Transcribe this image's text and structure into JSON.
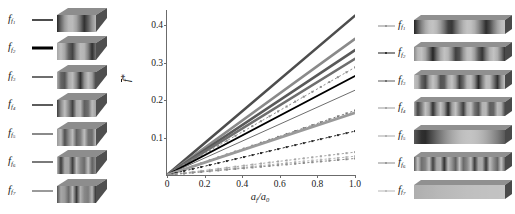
{
  "chart_data": {
    "type": "line",
    "title": "",
    "xlabel": "a_f/a_0",
    "ylabel": "f*",
    "xlim": [
      0,
      1.0
    ],
    "ylim": [
      0,
      0.44
    ],
    "xticks": [
      "0",
      "0.2",
      "0.4",
      "0.6",
      "0.8",
      "1.0"
    ],
    "xtick_values": [
      0,
      0.2,
      0.4,
      0.6,
      0.8,
      1.0
    ],
    "yticks": [
      "0.1",
      "0.2",
      "0.3",
      "0.4"
    ],
    "ytick_values": [
      0.1,
      0.2,
      0.3,
      0.4
    ],
    "grid": false,
    "legend": "none",
    "note": "All series are straight lines through the origin; value listed is y at x = 1.0 (the slope).",
    "series": [
      {
        "name": "f_f1 cube",
        "panel": "left",
        "style": "solid",
        "width": 2.6,
        "color": "#4d4d4d",
        "slope": 0.425,
        "values": [
          0,
          0.085,
          0.17,
          0.255,
          0.34,
          0.425
        ]
      },
      {
        "name": "f_f2 cube",
        "panel": "left",
        "style": "solid",
        "width": 2.6,
        "color": "#8a8a8a",
        "slope": 0.363,
        "values": [
          0,
          0.0726,
          0.1452,
          0.2178,
          0.2904,
          0.363
        ]
      },
      {
        "name": "f_f3 cube",
        "panel": "left",
        "style": "solid",
        "width": 2.6,
        "color": "#595959",
        "slope": 0.333,
        "values": [
          0,
          0.0666,
          0.1332,
          0.1998,
          0.2664,
          0.333
        ]
      },
      {
        "name": "f_f4 cube",
        "panel": "left",
        "style": "solid",
        "width": 2.6,
        "color": "#6e6e6e",
        "slope": 0.31,
        "values": [
          0,
          0.062,
          0.124,
          0.186,
          0.248,
          0.31
        ]
      },
      {
        "name": "f_f5 cube",
        "panel": "left",
        "style": "dotted-marker",
        "width": 1.0,
        "color": "#8f8f8f",
        "slope": 0.287,
        "values": [
          0,
          0.0574,
          0.1148,
          0.1722,
          0.2296,
          0.287
        ]
      },
      {
        "name": "f_f6 cube",
        "panel": "left",
        "style": "solid",
        "width": 1.9,
        "color": "#000000",
        "slope": 0.264,
        "values": [
          0,
          0.0528,
          0.1056,
          0.1584,
          0.2112,
          0.264
        ]
      },
      {
        "name": "f_f7 cube",
        "panel": "left",
        "style": "solid",
        "width": 0.9,
        "color": "#5c5c5c",
        "slope": 0.226,
        "values": [
          0,
          0.0452,
          0.0904,
          0.1356,
          0.1808,
          0.226
        ]
      },
      {
        "name": "f_f1 bar",
        "panel": "right",
        "style": "dotted-marker",
        "width": 1.0,
        "color": "#7a7a7a",
        "slope": 0.172,
        "values": [
          0,
          0.0344,
          0.0688,
          0.1032,
          0.1376,
          0.172
        ]
      },
      {
        "name": "f_f2 bar",
        "panel": "right",
        "style": "solid",
        "width": 2.8,
        "color": "#9a9a9a",
        "slope": 0.166,
        "values": [
          0,
          0.0332,
          0.0664,
          0.0996,
          0.1328,
          0.166
        ]
      },
      {
        "name": "f_f3 bar",
        "panel": "right",
        "style": "dotted-marker",
        "width": 1.0,
        "color": "#2b2b2b",
        "slope": 0.117,
        "values": [
          0,
          0.0234,
          0.0468,
          0.0702,
          0.0936,
          0.117
        ]
      },
      {
        "name": "f_f4 bar",
        "panel": "right",
        "style": "dotted-marker",
        "width": 1.0,
        "color": "#a6a6a6",
        "slope": 0.061,
        "values": [
          0,
          0.0122,
          0.0244,
          0.0366,
          0.0488,
          0.061
        ]
      },
      {
        "name": "f_f5 bar",
        "panel": "right",
        "style": "dotted-marker",
        "width": 1.0,
        "color": "#b5b5b5",
        "slope": 0.05,
        "values": [
          0,
          0.01,
          0.02,
          0.03,
          0.04,
          0.05
        ]
      },
      {
        "name": "f_f6 bar",
        "panel": "right",
        "style": "dotted-marker",
        "width": 1.0,
        "color": "#8c8c8c",
        "slope": 0.044,
        "values": [
          0,
          0.0088,
          0.0176,
          0.0264,
          0.0352,
          0.044
        ]
      }
    ]
  },
  "axis": {
    "x_title_main": "a",
    "x_title_sub": "f",
    "x_title_denom_main": "a",
    "x_title_denom_sub": "0",
    "x_title_slash": "/",
    "y_title_main": "f",
    "y_title_star": "*"
  },
  "left_panel": {
    "items": [
      {
        "label_main": "f",
        "label_sub": "f",
        "label_sub2": "1",
        "swatch_color": "#4d4d4d",
        "swatch_width": 2.2
      },
      {
        "label_main": "f",
        "label_sub": "f",
        "label_sub2": "2",
        "swatch_color": "#000000",
        "swatch_width": 3.2
      },
      {
        "label_main": "f",
        "label_sub": "f",
        "label_sub2": "3",
        "swatch_color": "#6e6e6e",
        "swatch_width": 2.0
      },
      {
        "label_main": "f",
        "label_sub": "f",
        "label_sub2": "4",
        "swatch_color": "#5c5c5c",
        "swatch_width": 2.0
      },
      {
        "label_main": "f",
        "label_sub": "f",
        "label_sub2": "5",
        "swatch_color": "#8a8a8a",
        "swatch_width": 2.0
      },
      {
        "label_main": "f",
        "label_sub": "f",
        "label_sub2": "6",
        "swatch_color": "#7a7a7a",
        "swatch_width": 2.0
      },
      {
        "label_main": "f",
        "label_sub": "f",
        "label_sub2": "7",
        "swatch_color": "#9a9a9a",
        "swatch_width": 2.0
      }
    ]
  },
  "right_panel": {
    "items": [
      {
        "label_main": "f",
        "label_sub": "f",
        "label_sub2": "1",
        "swatch_color": "#8a8a8a",
        "swatch_width": 1.2
      },
      {
        "label_main": "f",
        "label_sub": "f",
        "label_sub2": "2",
        "swatch_color": "#1a1a1a",
        "swatch_width": 1.4
      },
      {
        "label_main": "f",
        "label_sub": "f",
        "label_sub2": "3",
        "swatch_color": "#5c5c5c",
        "swatch_width": 1.2
      },
      {
        "label_main": "f",
        "label_sub": "f",
        "label_sub2": "4",
        "swatch_color": "#9a9a9a",
        "swatch_width": 1.2
      },
      {
        "label_main": "f",
        "label_sub": "f",
        "label_sub2": "5",
        "swatch_color": "#a6a6a6",
        "swatch_width": 1.2
      },
      {
        "label_main": "f",
        "label_sub": "f",
        "label_sub2": "6",
        "swatch_color": "#8c8c8c",
        "swatch_width": 1.2
      },
      {
        "label_main": "f",
        "label_sub": "f",
        "label_sub2": "7",
        "swatch_color": "#b5b5b5",
        "swatch_width": 1.2
      }
    ]
  },
  "colors": {
    "axis": "#6b6b6b",
    "text": "#1a1a1a",
    "background": "#ffffff"
  }
}
